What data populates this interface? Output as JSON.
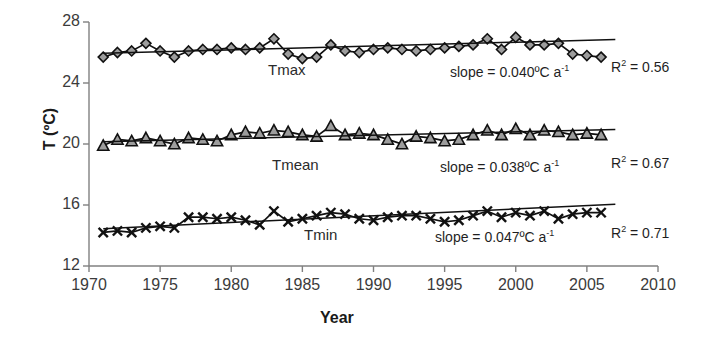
{
  "chart_data": {
    "type": "line",
    "title": "",
    "xlabel": "Year",
    "ylabel": "T (ºC)",
    "xlim": [
      1970,
      2010
    ],
    "ylim": [
      12,
      28
    ],
    "xticks": [
      1970,
      1975,
      1980,
      1985,
      1990,
      1995,
      2000,
      2005,
      2010
    ],
    "yticks": [
      12,
      16,
      20,
      24,
      28
    ],
    "grid": false,
    "legend": "inline-series-labels",
    "x": [
      1971,
      1972,
      1973,
      1974,
      1975,
      1976,
      1977,
      1978,
      1979,
      1980,
      1981,
      1982,
      1983,
      1984,
      1985,
      1986,
      1987,
      1988,
      1989,
      1990,
      1991,
      1992,
      1993,
      1994,
      1995,
      1996,
      1997,
      1998,
      1999,
      2000,
      2001,
      2002,
      2003,
      2004,
      2005,
      2006
    ],
    "series": [
      {
        "name": "Tmax",
        "marker": "diamond",
        "values": [
          25.7,
          26.0,
          26.1,
          26.6,
          26.1,
          25.7,
          26.1,
          26.2,
          26.2,
          26.3,
          26.2,
          26.3,
          26.9,
          25.9,
          25.6,
          25.7,
          26.5,
          26.1,
          26.0,
          26.2,
          26.3,
          26.2,
          26.1,
          26.2,
          26.3,
          26.4,
          26.5,
          26.9,
          26.2,
          27.0,
          26.5,
          26.5,
          26.6,
          25.9,
          25.8,
          25.7
        ],
        "slope_label": "slope = 0.040ºC a",
        "slope_exponent": "-1",
        "r2_label": "R",
        "r2_exponent": "2",
        "r2_value": "= 0.56"
      },
      {
        "name": "Tmean",
        "marker": "triangle",
        "values": [
          19.9,
          20.3,
          20.2,
          20.4,
          20.2,
          20.0,
          20.4,
          20.3,
          20.2,
          20.6,
          20.8,
          20.7,
          20.9,
          20.8,
          20.6,
          20.5,
          21.2,
          20.6,
          20.7,
          20.6,
          20.3,
          20.0,
          20.5,
          20.4,
          20.2,
          20.3,
          20.6,
          20.9,
          20.6,
          21.0,
          20.6,
          20.9,
          20.8,
          20.6,
          20.7,
          20.6
        ],
        "slope_label": "slope = 0.038ºC a",
        "slope_exponent": "-1",
        "r2_label": "R",
        "r2_exponent": "2",
        "r2_value": "= 0.67"
      },
      {
        "name": "Tmin",
        "marker": "cross",
        "values": [
          14.2,
          14.3,
          14.2,
          14.5,
          14.6,
          14.5,
          15.2,
          15.2,
          15.1,
          15.2,
          15.0,
          14.7,
          15.6,
          14.9,
          15.1,
          15.3,
          15.5,
          15.4,
          15.1,
          15.0,
          15.2,
          15.3,
          15.3,
          15.1,
          14.9,
          15.0,
          15.3,
          15.6,
          15.2,
          15.5,
          15.3,
          15.6,
          15.1,
          15.4,
          15.5,
          15.5
        ],
        "slope_label": "slope = 0.047ºC a",
        "slope_exponent": "-1",
        "r2_label": "R",
        "r2_exponent": "2",
        "r2_value": "= 0.71"
      }
    ],
    "trendlines": [
      {
        "name": "Tmax-trend",
        "x0": 1971,
        "x1": 2007,
        "y0": 25.95,
        "y1": 26.85
      },
      {
        "name": "Tmean-trend",
        "x0": 1971,
        "x1": 2007,
        "y0": 20.15,
        "y1": 20.95
      },
      {
        "name": "Tmin-trend",
        "x0": 1971,
        "x1": 2007,
        "y0": 14.45,
        "y1": 16.05
      }
    ]
  },
  "axes": {
    "y_title": "T (ºC)",
    "x_title": "Year"
  }
}
